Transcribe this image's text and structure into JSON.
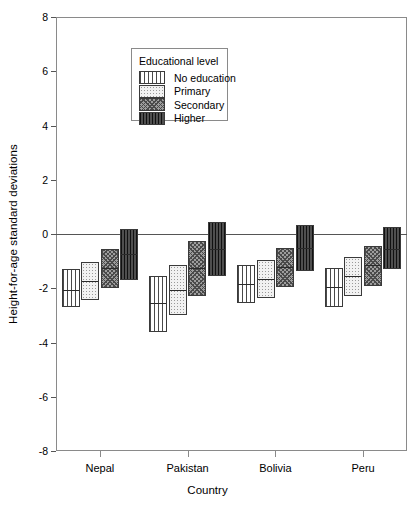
{
  "chart_data": {
    "type": "bar",
    "title": "",
    "xlabel": "Country",
    "ylabel": "Height-for-age standard deviations",
    "ylim": [
      -8,
      8
    ],
    "yticks": [
      8,
      6,
      4,
      2,
      0,
      -2,
      -4,
      -6,
      -8
    ],
    "ytick_labels": [
      "8",
      "6",
      "4",
      "2",
      "0",
      "-2",
      "-4",
      "-6",
      "-8"
    ],
    "grid": false,
    "zero_line": true,
    "legend_title": "Educational level",
    "legend_position": "upper-center-left",
    "categories": [
      "Nepal",
      "Pakistan",
      "Bolivia",
      "Peru"
    ],
    "note": "Each bar is a vertical range (box) spanning low to high with a median line",
    "series": [
      {
        "name": "No education",
        "pattern": "vertical-stripes",
        "bars": [
          {
            "category": "Nepal",
            "low": -2.7,
            "high": -1.3,
            "median": -2.05
          },
          {
            "category": "Pakistan",
            "low": -3.6,
            "high": -1.55,
            "median": -2.55
          },
          {
            "category": "Bolivia",
            "low": -2.55,
            "high": -1.15,
            "median": -1.85
          },
          {
            "category": "Peru",
            "low": -2.7,
            "high": -1.25,
            "median": -1.95
          }
        ]
      },
      {
        "name": "Primary",
        "pattern": "light-dots",
        "bars": [
          {
            "category": "Nepal",
            "low": -2.45,
            "high": -1.05,
            "median": -1.75
          },
          {
            "category": "Pakistan",
            "low": -3.0,
            "high": -1.15,
            "median": -2.05
          },
          {
            "category": "Bolivia",
            "low": -2.35,
            "high": -0.95,
            "median": -1.65
          },
          {
            "category": "Peru",
            "low": -2.3,
            "high": -0.85,
            "median": -1.55
          }
        ]
      },
      {
        "name": "Secondary",
        "pattern": "dark-crosshatch",
        "bars": [
          {
            "category": "Nepal",
            "low": -2.0,
            "high": -0.55,
            "median": -1.25
          },
          {
            "category": "Pakistan",
            "low": -2.3,
            "high": -0.25,
            "median": -1.25
          },
          {
            "category": "Bolivia",
            "low": -1.95,
            "high": -0.5,
            "median": -1.2
          },
          {
            "category": "Peru",
            "low": -1.9,
            "high": -0.45,
            "median": -1.15
          }
        ]
      },
      {
        "name": "Higher",
        "pattern": "solid-dark",
        "bars": [
          {
            "category": "Nepal",
            "low": -1.7,
            "high": 0.2,
            "median": -0.75
          },
          {
            "category": "Pakistan",
            "low": -1.55,
            "high": 0.45,
            "median": -0.55
          },
          {
            "category": "Bolivia",
            "low": -1.35,
            "high": 0.35,
            "median": -0.5
          },
          {
            "category": "Peru",
            "low": -1.3,
            "high": 0.25,
            "median": -0.55
          }
        ]
      }
    ]
  }
}
